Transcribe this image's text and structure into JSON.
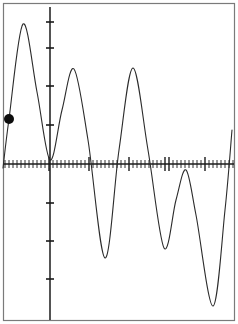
{
  "window": {
    "title": "Graph Viewport",
    "width": 238,
    "height": 324,
    "background_color": "#ffffff",
    "border_color": "#7a7a7a"
  },
  "axes": {
    "x_axis": {
      "name": "x-axis",
      "y_pixel": 164,
      "x_start": 3,
      "x_end": 234,
      "color": "#1a1a1a",
      "tick_spacing_px": 4,
      "tick_half_height_px": 4,
      "major_tick_half_height_px": 7,
      "major_tick_x_positions": [
        50,
        89,
        128,
        167,
        206
      ]
    },
    "y_axis": {
      "name": "y-axis",
      "x_pixel": 50,
      "y_start": 7,
      "y_end": 320,
      "color": "#1a1a1a",
      "tick_half_width_px": 4,
      "tick_y_positions": [
        22,
        48,
        86,
        125,
        203,
        241,
        279
      ]
    }
  },
  "marker": {
    "name": "trace-point",
    "x": 8,
    "y": 119,
    "radius": 5,
    "color": "#0d0d0d"
  },
  "chart_data": {
    "type": "line",
    "title": "",
    "subtitle": "",
    "xlabel": "",
    "ylabel": "",
    "grid": false,
    "legend": null,
    "axis_origin_px": {
      "x": 50,
      "y": 164
    },
    "xlim": [
      3,
      234
    ],
    "ylim": [
      320,
      7
    ],
    "series": [
      {
        "name": "damped-oscillation",
        "color": "#2b2b2b",
        "line_width": 1,
        "description": "Oscillating curve with decreasing peak amplitude and increasing trough depth, crossing the x-axis repeatedly",
        "keypoints_px": [
          {
            "x": 3,
            "y": 168,
            "kind": "start"
          },
          {
            "x": 9,
            "y": 119,
            "kind": "marker-point"
          },
          {
            "x": 23,
            "y": 24,
            "kind": "peak"
          },
          {
            "x": 37,
            "y": 92,
            "kind": "descent"
          },
          {
            "x": 50,
            "y": 160,
            "kind": "trough"
          },
          {
            "x": 62,
            "y": 110,
            "kind": "ascent"
          },
          {
            "x": 74,
            "y": 69,
            "kind": "peak"
          },
          {
            "x": 88,
            "y": 140,
            "kind": "descent"
          },
          {
            "x": 105,
            "y": 258,
            "kind": "trough"
          },
          {
            "x": 119,
            "y": 150,
            "kind": "ascent"
          },
          {
            "x": 133,
            "y": 68,
            "kind": "peak"
          },
          {
            "x": 148,
            "y": 150,
            "kind": "descent"
          },
          {
            "x": 164,
            "y": 248,
            "kind": "trough"
          },
          {
            "x": 176,
            "y": 200,
            "kind": "ascent"
          },
          {
            "x": 186,
            "y": 170,
            "kind": "peak"
          },
          {
            "x": 196,
            "y": 215,
            "kind": "descent"
          },
          {
            "x": 213,
            "y": 306,
            "kind": "trough"
          },
          {
            "x": 225,
            "y": 210,
            "kind": "ascent"
          },
          {
            "x": 232,
            "y": 130,
            "kind": "end"
          }
        ],
        "peaks": [
          {
            "x": 23,
            "y": 24
          },
          {
            "x": 74,
            "y": 69
          },
          {
            "x": 133,
            "y": 68
          },
          {
            "x": 186,
            "y": 170
          }
        ],
        "troughs": [
          {
            "x": 50,
            "y": 160
          },
          {
            "x": 105,
            "y": 258
          },
          {
            "x": 164,
            "y": 248
          },
          {
            "x": 213,
            "y": 306
          }
        ],
        "zero_crossings_px": [
          31,
          40,
          62,
          89,
          119,
          148,
          176,
          196,
          225,
          228
        ]
      }
    ]
  }
}
